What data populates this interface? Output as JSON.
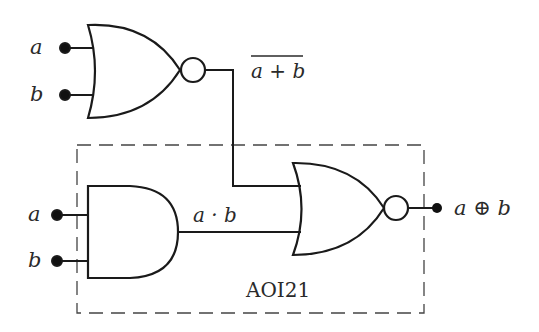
{
  "diagram": {
    "type": "logic-circuit",
    "inputs_top": [
      {
        "label": "a"
      },
      {
        "label": "b"
      }
    ],
    "inputs_bottom": [
      {
        "label": "a"
      },
      {
        "label": "b"
      }
    ],
    "nor1_output_label": "a + b",
    "and_output_label": "a · b",
    "final_output_label": "a ⊕ b",
    "block_label": "AOI21",
    "colors": {
      "stroke": "#1a1a1a",
      "text": "#2a2a2a",
      "background": "#ffffff"
    }
  }
}
